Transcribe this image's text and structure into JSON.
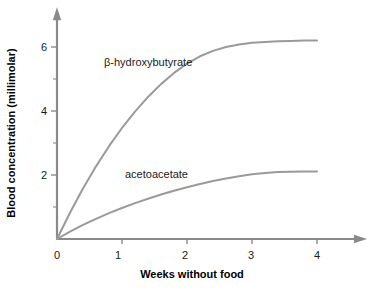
{
  "chart_data": {
    "type": "line",
    "title": "",
    "subtitle": "",
    "xlabel": "Weeks without food",
    "ylabel": "Blood concentration (millimolar)",
    "xlim": [
      0,
      4.6
    ],
    "ylim": [
      0,
      6.9
    ],
    "xticks": [
      0,
      1,
      2,
      3,
      4
    ],
    "xtick_labels": [
      "0",
      "1",
      "2",
      "3",
      "4"
    ],
    "yticks": [
      2,
      4,
      6
    ],
    "ytick_labels": [
      "2",
      "4",
      "6"
    ],
    "yminorticks": [
      1,
      3,
      5
    ],
    "grid": false,
    "legend": "inline-annotations",
    "axis_style": "arrow-tipped open axes",
    "line_color": "#9a9a9a",
    "axis_color": "#8a8a8a",
    "text_color": "#1a1a1a",
    "series": [
      {
        "name": "β-hydroxybutyrate",
        "label_x": 1.0,
        "label_y": 5.6,
        "x": [
          0,
          0.2,
          0.4,
          0.6,
          0.8,
          1.0,
          1.2,
          1.4,
          1.6,
          1.8,
          2.0,
          2.2,
          2.4,
          2.6,
          2.8,
          3.0,
          3.2,
          3.4,
          3.6,
          3.8,
          4.0
        ],
        "values": [
          0,
          0.82,
          1.58,
          2.27,
          2.9,
          3.47,
          3.98,
          4.44,
          4.84,
          5.19,
          5.48,
          5.71,
          5.88,
          6.0,
          6.08,
          6.13,
          6.16,
          6.18,
          6.19,
          6.2,
          6.2
        ]
      },
      {
        "name": "acetoacetate",
        "label_x": 1.05,
        "label_y": 2.0,
        "x": [
          0,
          0.2,
          0.4,
          0.6,
          0.8,
          1.0,
          1.2,
          1.4,
          1.6,
          1.8,
          2.0,
          2.2,
          2.4,
          2.6,
          2.8,
          3.0,
          3.2,
          3.4,
          3.6,
          3.8,
          4.0
        ],
        "values": [
          0,
          0.23,
          0.44,
          0.63,
          0.81,
          0.97,
          1.12,
          1.26,
          1.39,
          1.51,
          1.62,
          1.72,
          1.81,
          1.89,
          1.96,
          2.02,
          2.06,
          2.09,
          2.1,
          2.11,
          2.11
        ]
      }
    ]
  },
  "axes": {
    "x_title": "Weeks without food",
    "y_title": "Blood concentration (millimolar)"
  },
  "x_tick_labels": [
    "0",
    "1",
    "2",
    "3",
    "4"
  ],
  "y_tick_labels": [
    "2",
    "4",
    "6"
  ],
  "series_labels": {
    "bhb": "β-hydroxybutyrate",
    "aca": "acetoacetate"
  }
}
